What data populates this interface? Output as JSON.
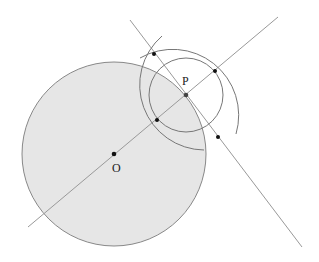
{
  "diagram": {
    "colors": {
      "big_circle_fill": "#e6e6e6",
      "stroke": "#888888",
      "point": "#111111"
    },
    "big_circle": {
      "label": "O",
      "cx": 114,
      "cy": 154,
      "r": 92
    },
    "small_circle": {
      "label": "P",
      "cx": 186,
      "cy": 95,
      "r": 37
    },
    "labels": {
      "O": "O",
      "P": "P"
    },
    "points": [
      {
        "name": "O",
        "x": 114,
        "y": 154
      },
      {
        "name": "P",
        "x": 186,
        "y": 95
      },
      {
        "name": "A",
        "x": 157,
        "y": 120
      },
      {
        "name": "B",
        "x": 215,
        "y": 71
      },
      {
        "name": "C",
        "x": 154,
        "y": 54
      },
      {
        "name": "D",
        "x": 218,
        "y": 137
      }
    ],
    "lines": [
      {
        "name": "line-OP",
        "x1": 28,
        "y1": 227,
        "x2": 278,
        "y2": 17
      },
      {
        "name": "perpendicular-bisector",
        "x1": 130,
        "y1": 20,
        "x2": 302,
        "y2": 247
      }
    ]
  }
}
